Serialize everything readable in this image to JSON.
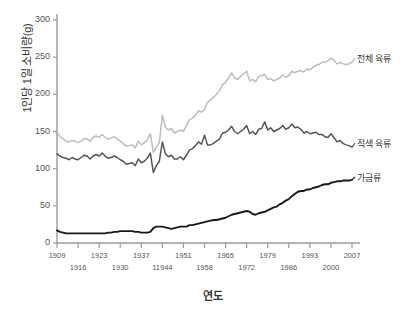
{
  "chart_data": {
    "type": "line",
    "title": "",
    "xlabel": "연도",
    "ylabel": "1인당 1일 소비량(g)",
    "xlim": [
      1909,
      2007
    ],
    "ylim": [
      0,
      300
    ],
    "grid": false,
    "legend_position": "right-inline",
    "yticks": [
      "0",
      "50",
      "100",
      "150",
      "200",
      "250",
      "300"
    ],
    "ytick_values": [
      0,
      50,
      100,
      150,
      200,
      250,
      300
    ],
    "xticks": [
      "1909",
      "1916",
      "1923",
      "1930",
      "1937",
      "11944",
      "1951",
      "1958",
      "1965",
      "1972",
      "1979",
      "1986",
      "1993",
      "2000",
      "2007"
    ],
    "xtick_values": [
      1909,
      1916,
      1923,
      1930,
      1937,
      1944,
      1951,
      1958,
      1965,
      1972,
      1979,
      1986,
      1993,
      2000,
      2007
    ],
    "x": [
      1909,
      1910,
      1911,
      1912,
      1913,
      1914,
      1915,
      1916,
      1917,
      1918,
      1919,
      1920,
      1921,
      1922,
      1923,
      1924,
      1925,
      1926,
      1927,
      1928,
      1929,
      1930,
      1931,
      1932,
      1933,
      1934,
      1935,
      1936,
      1937,
      1938,
      1939,
      1940,
      1941,
      1942,
      1943,
      1944,
      1945,
      1946,
      1947,
      1948,
      1949,
      1950,
      1951,
      1952,
      1953,
      1954,
      1955,
      1956,
      1957,
      1958,
      1959,
      1960,
      1961,
      1962,
      1963,
      1964,
      1965,
      1966,
      1967,
      1968,
      1969,
      1970,
      1971,
      1972,
      1973,
      1974,
      1975,
      1976,
      1977,
      1978,
      1979,
      1980,
      1981,
      1982,
      1983,
      1984,
      1985,
      1986,
      1987,
      1988,
      1989,
      1990,
      1991,
      1992,
      1993,
      1994,
      1995,
      1996,
      1997,
      1998,
      1999,
      2000,
      2001,
      2002,
      2003,
      2004,
      2005,
      2006,
      2007
    ],
    "series": [
      {
        "name": "전체 육류",
        "color": "#bdbdbd",
        "label_position": {
          "x": 357,
          "y": 58
        },
        "values": [
          149,
          143,
          140,
          137,
          136,
          138,
          137,
          135,
          137,
          141,
          140,
          137,
          142,
          144,
          142,
          146,
          142,
          140,
          141,
          143,
          140,
          137,
          134,
          130,
          131,
          132,
          128,
          137,
          132,
          135,
          139,
          147,
          122,
          129,
          135,
          172,
          156,
          152,
          154,
          148,
          150,
          152,
          150,
          158,
          166,
          168,
          172,
          178,
          176,
          180,
          189,
          193,
          196,
          200,
          205,
          213,
          216,
          222,
          229,
          222,
          220,
          224,
          228,
          231,
          218,
          220,
          217,
          224,
          225,
          227,
          220,
          221,
          218,
          220,
          222,
          226,
          223,
          225,
          231,
          229,
          231,
          232,
          230,
          234,
          233,
          236,
          239,
          240,
          243,
          243,
          245,
          249,
          246,
          241,
          243,
          241,
          240,
          241,
          243
        ]
      },
      {
        "name": "적색 육류",
        "color": "#555555",
        "label_position": {
          "x": 357,
          "y": 143
        },
        "values": [
          120,
          117,
          115,
          114,
          112,
          115,
          113,
          112,
          115,
          118,
          117,
          113,
          117,
          119,
          117,
          121,
          117,
          114,
          115,
          117,
          115,
          112,
          110,
          106,
          107,
          108,
          104,
          113,
          108,
          110,
          114,
          121,
          95,
          104,
          110,
          136,
          120,
          116,
          118,
          113,
          113,
          116,
          112,
          118,
          125,
          127,
          131,
          136,
          133,
          145,
          132,
          132,
          134,
          137,
          140,
          148,
          149,
          152,
          157,
          150,
          147,
          150,
          153,
          158,
          147,
          150,
          146,
          153,
          154,
          163,
          152,
          155,
          150,
          152,
          154,
          158,
          153,
          155,
          160,
          155,
          156,
          153,
          148,
          150,
          147,
          148,
          149,
          146,
          146,
          143,
          142,
          147,
          142,
          136,
          138,
          134,
          132,
          131,
          129
        ]
      },
      {
        "name": "가금류",
        "color": "#1a1a1a",
        "label_position": {
          "x": 357,
          "y": 177
        },
        "values": [
          17,
          15,
          14,
          13,
          13,
          13,
          13,
          13,
          13,
          13,
          13,
          13,
          13,
          13,
          13,
          13,
          13,
          14,
          14,
          15,
          15,
          16,
          16,
          16,
          16,
          16,
          15,
          15,
          14,
          14,
          14,
          15,
          20,
          22,
          22,
          22,
          21,
          20,
          19,
          20,
          21,
          22,
          22,
          22,
          24,
          24,
          25,
          26,
          27,
          28,
          29,
          30,
          31,
          31,
          32,
          33,
          34,
          36,
          38,
          39,
          40,
          41,
          42,
          43,
          42,
          39,
          38,
          40,
          41,
          42,
          44,
          46,
          48,
          49,
          52,
          54,
          57,
          59,
          63,
          66,
          69,
          70,
          70,
          72,
          72,
          74,
          75,
          76,
          78,
          79,
          79,
          81,
          82,
          83,
          83,
          84,
          84,
          84,
          85
        ]
      }
    ]
  }
}
